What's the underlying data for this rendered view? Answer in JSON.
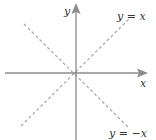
{
  "diagram": {
    "type": "coordinate-axes",
    "axes": {
      "x_label": "x",
      "y_label": "y",
      "color": "#8c8c8c"
    },
    "lines": [
      {
        "label": "y = x",
        "slope": 1,
        "style": "dashed",
        "color": "#a6a6a6"
      },
      {
        "label": "y = −x",
        "slope": -1,
        "style": "dashed",
        "color": "#a6a6a6"
      }
    ]
  }
}
